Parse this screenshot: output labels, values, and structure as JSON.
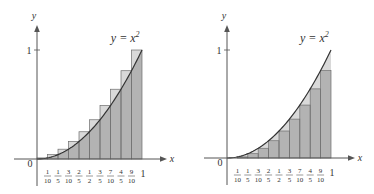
{
  "chart_data": [
    {
      "type": "bar",
      "title": "Upper Riemann sum (right endpoints) for y = x^2",
      "curve_label": "y = x²",
      "xlabel": "x",
      "ylabel": "y",
      "origin_label": "0",
      "y_tick_label": "1",
      "x_end_label": "1",
      "x_tick_labels": [
        {
          "num": "1",
          "den": "10"
        },
        {
          "num": "1",
          "den": "5"
        },
        {
          "num": "3",
          "den": "10"
        },
        {
          "num": "2",
          "den": "5"
        },
        {
          "num": "1",
          "den": "2"
        },
        {
          "num": "3",
          "den": "5"
        },
        {
          "num": "7",
          "den": "10"
        },
        {
          "num": "4",
          "den": "5"
        },
        {
          "num": "9",
          "den": "10"
        }
      ],
      "categories": [
        "[0,0.1]",
        "[0.1,0.2]",
        "[0.2,0.3]",
        "[0.3,0.4]",
        "[0.4,0.5]",
        "[0.5,0.6]",
        "[0.6,0.7]",
        "[0.7,0.8]",
        "[0.8,0.9]",
        "[0.9,1]"
      ],
      "values": [
        0.01,
        0.04,
        0.09,
        0.16,
        0.25,
        0.36,
        0.49,
        0.64,
        0.81,
        1.0
      ],
      "xlim": [
        0,
        1
      ],
      "ylim": [
        0,
        1
      ],
      "grid": false,
      "geom": {
        "ox": 37,
        "oy": 159,
        "ux": 105,
        "uy": 109,
        "axis_left": 14,
        "axis_right": 167,
        "y_top": 25,
        "y_bottom": 186
      }
    },
    {
      "type": "bar",
      "title": "Lower Riemann sum (left endpoints) for y = x^2",
      "curve_label": "y = x²",
      "xlabel": "x",
      "ylabel": "y",
      "origin_label": "0",
      "y_tick_label": "1",
      "x_end_label": "1",
      "x_tick_labels": [
        {
          "num": "1",
          "den": "10"
        },
        {
          "num": "1",
          "den": "5"
        },
        {
          "num": "3",
          "den": "10"
        },
        {
          "num": "2",
          "den": "5"
        },
        {
          "num": "1",
          "den": "2"
        },
        {
          "num": "3",
          "den": "5"
        },
        {
          "num": "7",
          "den": "10"
        },
        {
          "num": "4",
          "den": "5"
        },
        {
          "num": "9",
          "den": "10"
        }
      ],
      "categories": [
        "[0,0.1]",
        "[0.1,0.2]",
        "[0.2,0.3]",
        "[0.3,0.4]",
        "[0.4,0.5]",
        "[0.5,0.6]",
        "[0.6,0.7]",
        "[0.7,0.8]",
        "[0.8,0.9]",
        "[0.9,1]"
      ],
      "values": [
        0.0,
        0.01,
        0.04,
        0.09,
        0.16,
        0.25,
        0.36,
        0.49,
        0.64,
        0.81
      ],
      "xlim": [
        0,
        1
      ],
      "ylim": [
        0,
        1
      ],
      "grid": false,
      "geom": {
        "ox": 227,
        "oy": 158,
        "ux": 104,
        "uy": 108,
        "axis_left": 204,
        "axis_right": 355,
        "y_top": 25,
        "y_bottom": 185
      }
    }
  ],
  "colors": {
    "bar_fill": "#b3b3b3",
    "excess_fill": "#d9d9d9",
    "bar_stroke": "#6e6e6e",
    "axis": "#555555",
    "curve": "#333333",
    "text": "#333333"
  }
}
